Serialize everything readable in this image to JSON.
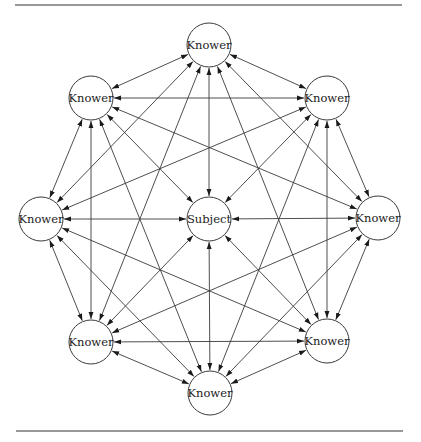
{
  "diagram": {
    "type": "network",
    "node_radius": 22,
    "colors": {
      "stroke": "#3a3a3a",
      "text": "#222222",
      "background": "#ffffff"
    },
    "nodes": [
      {
        "id": "subject",
        "label": "Subject",
        "x": 209,
        "y": 219
      },
      {
        "id": "k_top",
        "label": "Knower",
        "x": 209,
        "y": 45
      },
      {
        "id": "k_upper_right",
        "label": "Knower",
        "x": 327,
        "y": 98
      },
      {
        "id": "k_right",
        "label": "Knower",
        "x": 378,
        "y": 218
      },
      {
        "id": "k_lower_right",
        "label": "Knower",
        "x": 327,
        "y": 341
      },
      {
        "id": "k_bottom",
        "label": "Knower",
        "x": 210,
        "y": 393
      },
      {
        "id": "k_lower_left",
        "label": "Knower",
        "x": 91,
        "y": 342
      },
      {
        "id": "k_left",
        "label": "Knower",
        "x": 41,
        "y": 219
      },
      {
        "id": "k_upper_left",
        "label": "Knower",
        "x": 91,
        "y": 98
      }
    ],
    "edges_note": "All edges are double-headed arrows",
    "edges": [
      [
        "k_top",
        "subject"
      ],
      [
        "k_upper_right",
        "subject"
      ],
      [
        "k_right",
        "subject"
      ],
      [
        "k_lower_right",
        "subject"
      ],
      [
        "k_bottom",
        "subject"
      ],
      [
        "k_lower_left",
        "subject"
      ],
      [
        "k_left",
        "subject"
      ],
      [
        "k_upper_left",
        "subject"
      ],
      [
        "k_top",
        "k_upper_right"
      ],
      [
        "k_top",
        "k_right"
      ],
      [
        "k_top",
        "k_lower_right"
      ],
      [
        "k_top",
        "k_lower_left"
      ],
      [
        "k_top",
        "k_left"
      ],
      [
        "k_top",
        "k_upper_left"
      ],
      [
        "k_upper_right",
        "k_right"
      ],
      [
        "k_upper_right",
        "k_lower_right"
      ],
      [
        "k_upper_right",
        "k_bottom"
      ],
      [
        "k_upper_right",
        "k_left"
      ],
      [
        "k_upper_right",
        "k_upper_left"
      ],
      [
        "k_right",
        "k_lower_right"
      ],
      [
        "k_right",
        "k_bottom"
      ],
      [
        "k_right",
        "k_lower_left"
      ],
      [
        "k_right",
        "k_upper_left"
      ],
      [
        "k_lower_right",
        "k_bottom"
      ],
      [
        "k_lower_right",
        "k_lower_left"
      ],
      [
        "k_lower_right",
        "k_left"
      ],
      [
        "k_bottom",
        "k_lower_left"
      ],
      [
        "k_bottom",
        "k_left"
      ],
      [
        "k_bottom",
        "k_upper_left"
      ],
      [
        "k_lower_left",
        "k_left"
      ],
      [
        "k_lower_left",
        "k_upper_left"
      ],
      [
        "k_left",
        "k_upper_left"
      ]
    ],
    "rules": {
      "top": {
        "x1": 15,
        "x2": 402,
        "y": 5
      },
      "bottom": {
        "x1": 16,
        "x2": 403,
        "y": 431
      }
    }
  }
}
